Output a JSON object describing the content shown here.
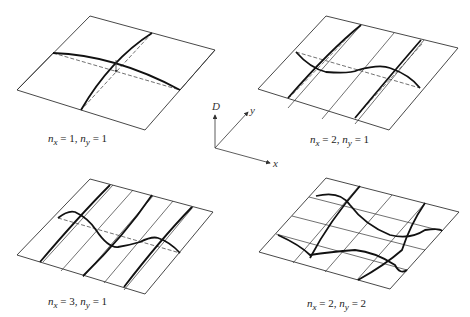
{
  "diagram": {
    "type": "standing-wave-modes-rectangular-membrane",
    "panels": [
      {
        "id": "mode-1-1",
        "nx": "1",
        "ny": "1",
        "label_nx": "n",
        "label_sub_x": "x",
        "label_eq1": " = 1, ",
        "label_ny": "n",
        "label_sub_y": "y",
        "label_eq2": " = 1"
      },
      {
        "id": "mode-2-1",
        "nx": "2",
        "ny": "1",
        "label_nx": "n",
        "label_sub_x": "x",
        "label_eq1": " = 2, ",
        "label_ny": "n",
        "label_sub_y": "y",
        "label_eq2": " = 1"
      },
      {
        "id": "mode-3-1",
        "nx": "3",
        "ny": "1",
        "label_nx": "n",
        "label_sub_x": "x",
        "label_eq1": " = 3, ",
        "label_ny": "n",
        "label_sub_y": "y",
        "label_eq2": " = 1"
      },
      {
        "id": "mode-2-2",
        "nx": "2",
        "ny": "2",
        "label_nx": "n",
        "label_sub_x": "x",
        "label_eq1": " = 2, ",
        "label_ny": "n",
        "label_sub_y": "y",
        "label_eq2": " = 2"
      }
    ],
    "axes": {
      "vertical": "D",
      "depth": "y",
      "horizontal": "x"
    },
    "colors": {
      "line": "#222222",
      "thin_line": "#333333",
      "background": "#ffffff"
    }
  }
}
